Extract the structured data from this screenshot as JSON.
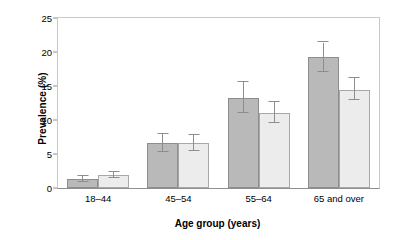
{
  "chart_data": {
    "type": "bar",
    "title": "",
    "xlabel": "Age group (years)",
    "ylabel": "Prevalence (%)",
    "categories": [
      "18–44",
      "45–54",
      "55–64",
      "65 and over"
    ],
    "ylim": [
      0,
      25
    ],
    "yticks": [
      0,
      5,
      10,
      15,
      20,
      25
    ],
    "ytick_labels": [
      "0",
      "5",
      "10",
      "15",
      "20",
      "25"
    ],
    "grid": false,
    "legend": "none",
    "series": [
      {
        "name": "series-1",
        "color": "#b9b9b9",
        "values": [
          1.3,
          6.6,
          13.3,
          19.2
        ],
        "err_low": [
          0.9,
          5.3,
          11.0,
          17.0
        ],
        "err_high": [
          1.8,
          7.9,
          15.6,
          21.4
        ]
      },
      {
        "name": "series-2",
        "color": "#ececec",
        "values": [
          1.9,
          6.6,
          11.1,
          14.4
        ],
        "err_low": [
          1.4,
          5.5,
          9.5,
          12.9
        ],
        "err_high": [
          2.4,
          7.8,
          12.6,
          16.2
        ]
      }
    ]
  }
}
